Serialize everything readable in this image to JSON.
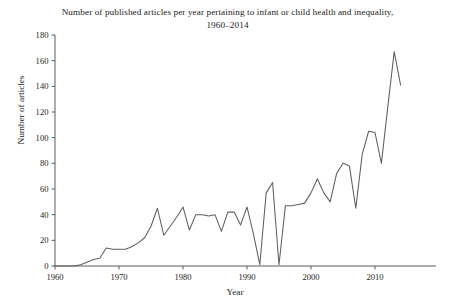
{
  "chart_data": {
    "type": "line",
    "title": "Number of published articles per year pertaining to infant or child health and inequality, 1960–2014",
    "xlabel": "Year",
    "ylabel": "Number of articles",
    "xlim": [
      1960,
      2014
    ],
    "ylim": [
      0,
      180
    ],
    "grid": false,
    "legend": "none",
    "xticks": [
      1960,
      1970,
      1980,
      1990,
      2000,
      2010
    ],
    "xtick_labels": [
      "1960",
      "1970",
      "1980",
      "1990",
      "2000",
      "2010"
    ],
    "yticks": [
      0,
      20,
      40,
      60,
      80,
      100,
      120,
      140,
      160,
      180
    ],
    "ytick_labels": [
      "0",
      "20",
      "40",
      "60",
      "80",
      "100",
      "120",
      "140",
      "160",
      "180"
    ],
    "line_color": "#5f5f5f",
    "x": [
      1960,
      1961,
      1962,
      1963,
      1964,
      1965,
      1966,
      1967,
      1968,
      1969,
      1970,
      1971,
      1972,
      1973,
      1974,
      1975,
      1976,
      1977,
      1978,
      1979,
      1980,
      1981,
      1982,
      1983,
      1984,
      1985,
      1986,
      1987,
      1988,
      1989,
      1990,
      1991,
      1992,
      1993,
      1994,
      1995,
      1996,
      1997,
      1998,
      1999,
      2000,
      2001,
      2002,
      2003,
      2004,
      2005,
      2006,
      2007,
      2008,
      2009,
      2010,
      2011,
      2012,
      2013,
      2014
    ],
    "values": [
      0,
      0,
      0,
      0,
      1,
      3,
      5,
      6,
      14,
      13,
      13,
      13,
      15,
      18,
      22,
      31,
      45,
      24,
      31,
      38,
      46,
      28,
      40,
      40,
      39,
      40,
      27,
      42,
      42,
      32,
      46,
      25,
      1,
      57,
      65,
      1,
      47,
      47,
      48,
      49,
      57,
      68,
      57,
      50,
      72,
      80,
      78,
      45,
      87,
      105,
      104,
      80,
      124,
      167,
      141
    ],
    "series_name": "Published articles per year"
  },
  "figure": {
    "background": "#ffffff",
    "font_color": "#1d1d1d"
  }
}
